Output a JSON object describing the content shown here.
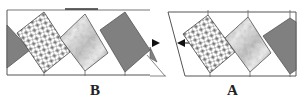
{
  "figure": {
    "panels": [
      {
        "id": "B",
        "label": "B",
        "position": "left",
        "tiles": [
          "gray-triangle",
          "hatched-square",
          "textured-square",
          "gray-square"
        ]
      },
      {
        "id": "A",
        "label": "A",
        "position": "right",
        "tiles": [
          "hatched-square",
          "textured-square",
          "gray-square"
        ]
      }
    ],
    "arrows": [
      {
        "direction": "right",
        "glyph": "►"
      },
      {
        "direction": "left",
        "glyph": "◄"
      }
    ],
    "colors": {
      "gray_tile": "#808080",
      "frame_line": "#555555",
      "hatch_light": "#ffffff",
      "hatch_dark": "#555555",
      "texture_light": "#e8e8e8",
      "texture_dark": "#6a6a6a"
    }
  }
}
